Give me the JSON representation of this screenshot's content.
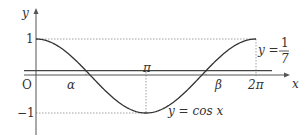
{
  "chart_data": {
    "type": "line",
    "title": "",
    "xlabel": "x",
    "ylabel": "y",
    "xlim": [
      0,
      6.2832
    ],
    "ylim": [
      -1,
      1
    ],
    "grid": false,
    "series": [
      {
        "name": "y = cos x",
        "function": "cos",
        "domain": [
          0,
          6.2832
        ]
      },
      {
        "name": "y = 1/7",
        "constant": 0.142857
      }
    ],
    "x_tick_labels": [
      "O",
      "α",
      "π",
      "β",
      "2π"
    ],
    "y_tick_labels": [
      "1",
      "−1"
    ],
    "intersections": [
      {
        "name": "α",
        "x": 1.4274,
        "y": 0.142857
      },
      {
        "name": "β",
        "x": 4.8558,
        "y": 0.142857
      }
    ]
  },
  "labels": {
    "y_axis": "y",
    "x_axis": "x",
    "origin": "O",
    "y_one": "1",
    "y_minus_one": "−1",
    "alpha": "α",
    "beta": "β",
    "pi": "π",
    "two_pi": "2π",
    "curve_label": "y = cos x",
    "line_label_lhs": "y =",
    "line_label_num": "1",
    "line_label_den": "7"
  }
}
